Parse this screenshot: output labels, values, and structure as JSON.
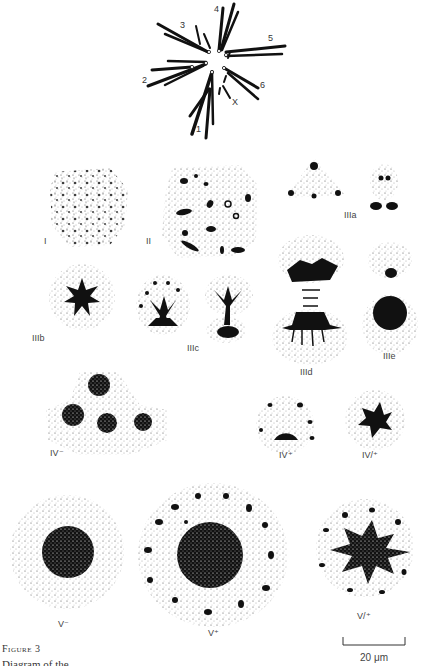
{
  "figure": {
    "caption_title": "Figure 3",
    "caption_text_partial": "Diagram of the ..."
  },
  "chromosomes": {
    "labels": [
      "1",
      "2",
      "3",
      "4",
      "5",
      "6",
      "X"
    ]
  },
  "stages": [
    {
      "id": "I",
      "label": "I"
    },
    {
      "id": "II",
      "label": "II"
    },
    {
      "id": "IIIa",
      "label": "IIIa"
    },
    {
      "id": "IIIb",
      "label": "IIIb"
    },
    {
      "id": "IIIc",
      "label": "IIIc"
    },
    {
      "id": "IIId",
      "label": "IIId"
    },
    {
      "id": "IIIe",
      "label": "IIIe"
    },
    {
      "id": "IV-",
      "label": "IV⁻"
    },
    {
      "id": "IV+",
      "label": "IV⁺"
    },
    {
      "id": "IV/+",
      "label": "IV/⁺"
    },
    {
      "id": "V-",
      "label": "V⁻"
    },
    {
      "id": "V+",
      "label": "V⁺"
    },
    {
      "id": "V/+",
      "label": "V/⁺"
    }
  ],
  "scale_bar": {
    "label": "20 μm"
  }
}
